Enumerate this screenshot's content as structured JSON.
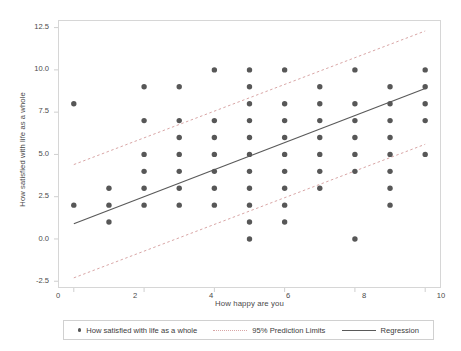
{
  "chart_data": {
    "type": "scatter",
    "title": "",
    "xlabel": "How happy are you",
    "ylabel": "How satisfied with life as a whole",
    "xlim": [
      -0.45,
      10.45
    ],
    "ylim": [
      -2.9,
      12.95
    ],
    "xticks": [
      "0",
      "2",
      "4",
      "6",
      "8",
      "10"
    ],
    "xtick_values": [
      0,
      2,
      4,
      6,
      8,
      10
    ],
    "yticks": [
      "12.5",
      "10.0",
      "7.5",
      "5.0",
      "2.5",
      "0.0",
      "-2.5"
    ],
    "ytick_values": [
      12.5,
      10.0,
      7.5,
      5.0,
      2.5,
      0.0,
      -2.5
    ],
    "grid": false,
    "legend_position": "bottom",
    "marker_color": "#575757",
    "regression_color": "#5a5a5a",
    "prediction_color": "#d9a6a6",
    "points": [
      [
        0,
        8
      ],
      [
        0,
        2
      ],
      [
        1,
        3
      ],
      [
        1,
        2
      ],
      [
        1,
        1
      ],
      [
        2,
        9
      ],
      [
        2,
        7
      ],
      [
        2,
        5
      ],
      [
        2,
        4
      ],
      [
        2,
        3
      ],
      [
        2,
        2
      ],
      [
        3,
        9
      ],
      [
        3,
        7
      ],
      [
        3,
        6
      ],
      [
        3,
        5
      ],
      [
        3,
        4
      ],
      [
        3,
        3
      ],
      [
        3,
        2
      ],
      [
        4,
        10
      ],
      [
        4,
        7
      ],
      [
        4,
        6
      ],
      [
        4,
        5
      ],
      [
        4,
        4
      ],
      [
        4,
        3
      ],
      [
        4,
        2
      ],
      [
        5,
        10
      ],
      [
        5,
        9
      ],
      [
        5,
        8
      ],
      [
        5,
        7
      ],
      [
        5,
        6
      ],
      [
        5,
        5
      ],
      [
        5,
        4
      ],
      [
        5,
        3
      ],
      [
        5,
        2
      ],
      [
        5,
        1
      ],
      [
        5,
        0
      ],
      [
        6,
        10
      ],
      [
        6,
        8
      ],
      [
        6,
        7
      ],
      [
        6,
        6
      ],
      [
        6,
        5
      ],
      [
        6,
        4
      ],
      [
        6,
        3
      ],
      [
        6,
        2
      ],
      [
        6,
        1
      ],
      [
        7,
        9
      ],
      [
        7,
        8
      ],
      [
        7,
        7
      ],
      [
        7,
        6
      ],
      [
        7,
        5
      ],
      [
        7,
        4
      ],
      [
        7,
        3
      ],
      [
        8,
        10
      ],
      [
        8,
        8
      ],
      [
        8,
        7
      ],
      [
        8,
        6
      ],
      [
        8,
        5
      ],
      [
        8,
        4
      ],
      [
        8,
        0
      ],
      [
        9,
        9
      ],
      [
        9,
        8
      ],
      [
        9,
        7
      ],
      [
        9,
        6
      ],
      [
        9,
        5
      ],
      [
        9,
        4
      ],
      [
        9,
        3
      ],
      [
        9,
        2
      ],
      [
        10,
        10
      ],
      [
        10,
        9
      ],
      [
        10,
        8
      ],
      [
        10,
        7
      ],
      [
        10,
        5
      ]
    ],
    "regression": {
      "label": "Regression",
      "x": [
        0,
        10
      ],
      "y": [
        0.9,
        8.9
      ]
    },
    "prediction_limits": {
      "label": "95% Prediction Limits",
      "upper": {
        "x": [
          0,
          10
        ],
        "y": [
          4.4,
          12.3
        ]
      },
      "lower": {
        "x": [
          0,
          10
        ],
        "y": [
          -2.3,
          5.6
        ]
      }
    },
    "series_label": "How satisfied with life as a whole"
  },
  "legend": {
    "scatter_label": "How satisfied with life as a whole",
    "prediction_label": "95% Prediction Limits",
    "regression_label": "Regression"
  }
}
